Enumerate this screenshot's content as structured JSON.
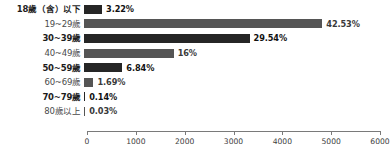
{
  "chart_data": {
    "type": "bar",
    "orientation": "horizontal",
    "title": "",
    "subtitle": "",
    "xlabel": "",
    "ylabel": "",
    "xlim": [
      0,
      6000
    ],
    "xticks": [
      0,
      1000,
      2000,
      3000,
      4000,
      5000,
      6000
    ],
    "xtick_labels": [
      "0",
      "1000",
      "2000",
      "3000",
      "4000",
      "5000",
      "6000"
    ],
    "grid": false,
    "legend": false,
    "categories": [
      "18歲（含）以下",
      "19~29歲",
      "30~39歲",
      "40~49歲",
      "50~59歲",
      "60~69歲",
      "70~79歲",
      "80歲以上"
    ],
    "values": [
      370,
      4880,
      3390,
      1836,
      785,
      194,
      16,
      3
    ],
    "percent_labels": [
      "3.22%",
      "42.53%",
      "29.54%",
      "16%",
      "6.84%",
      "1.69%",
      "0.14%",
      "0.03%"
    ],
    "percents": [
      3.22,
      42.53,
      29.54,
      16.0,
      6.84,
      1.69,
      0.14,
      0.03
    ],
    "bar_colors": [
      "#262626",
      "#555555",
      "#262626",
      "#555555",
      "#262626",
      "#555555",
      "#262626",
      "#555555"
    ],
    "colors": {
      "bar_dark": "#262626",
      "bar_gray": "#555555",
      "axis": "#7a7a7a",
      "label_text": "#4a4a4a",
      "value_text": "#111111",
      "background": "#ffffff"
    },
    "bars": [
      {
        "category": "18歲（含）以下",
        "value": 370,
        "percent_label": "3.22%",
        "shade": "dark",
        "emphasis": true
      },
      {
        "category": "19~29歲",
        "value": 4880,
        "percent_label": "42.53%",
        "shade": "gray",
        "emphasis": false
      },
      {
        "category": "30~39歲",
        "value": 3390,
        "percent_label": "29.54%",
        "shade": "dark",
        "emphasis": true
      },
      {
        "category": "40~49歲",
        "value": 1836,
        "percent_label": "16%",
        "shade": "gray",
        "emphasis": false
      },
      {
        "category": "50~59歲",
        "value": 785,
        "percent_label": "6.84%",
        "shade": "dark",
        "emphasis": true
      },
      {
        "category": "60~69歲",
        "value": 194,
        "percent_label": "1.69%",
        "shade": "gray",
        "emphasis": false
      },
      {
        "category": "70~79歲",
        "value": 16,
        "percent_label": "0.14%",
        "shade": "dark",
        "emphasis": true
      },
      {
        "category": "80歲以上",
        "value": 3,
        "percent_label": "0.03%",
        "shade": "gray",
        "emphasis": false
      }
    ]
  }
}
